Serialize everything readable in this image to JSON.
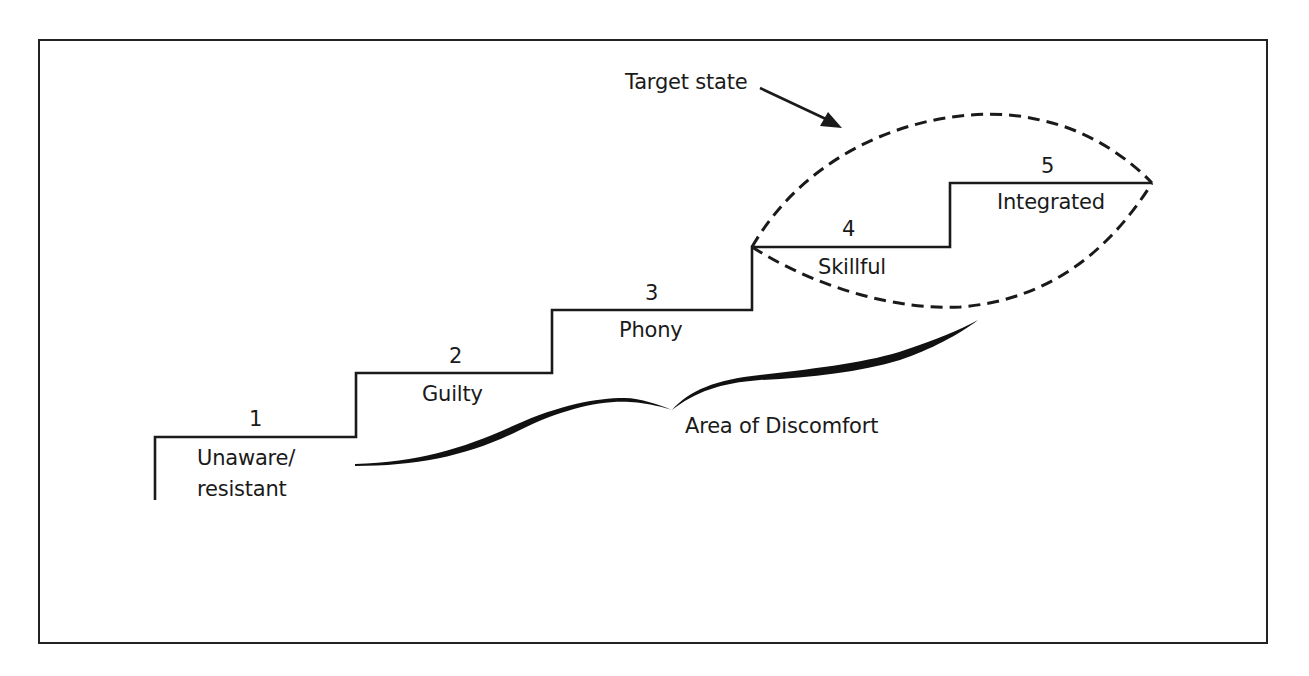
{
  "diagram": {
    "title": "",
    "stages": [
      {
        "number": "1",
        "label_line1": "Unaware/",
        "label_line2": "resistant"
      },
      {
        "number": "2",
        "label_line1": "Guilty"
      },
      {
        "number": "3",
        "label_line1": "Phony"
      },
      {
        "number": "4",
        "label_line1": "Skillful"
      },
      {
        "number": "5",
        "label_line1": "Integrated"
      }
    ],
    "annotations": {
      "target_state": "Target state",
      "discomfort": "Area of Discomfort"
    },
    "colors": {
      "line": "#1a1a1a",
      "background": "#ffffff"
    }
  }
}
